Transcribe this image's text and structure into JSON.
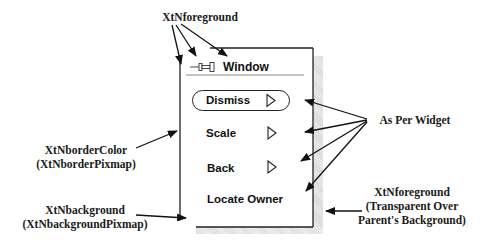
{
  "diagram": {
    "window": {
      "header_title": "Window",
      "pushpin_icon": "pushpin-icon",
      "menu_items": [
        {
          "label": "Dismiss",
          "has_submenu_triangle": true,
          "is_default": true
        },
        {
          "label": "Scale",
          "has_submenu_triangle": true,
          "is_default": false
        },
        {
          "label": "Back",
          "has_submenu_triangle": true,
          "is_default": false
        },
        {
          "label": "Locate Owner",
          "has_submenu_triangle": false,
          "is_default": false
        }
      ]
    },
    "annotations": {
      "top_foreground": "XtNforeground",
      "border_color_line1": "XtNborderColor",
      "border_color_line2": "(XtNborderPixmap)",
      "background_line1": "XtNbackground",
      "background_line2": "(XtNbackgroundPixmap)",
      "as_per_widget": "As Per Widget",
      "shadow_foreground_line1": "XtNforeground",
      "shadow_foreground_line2": "(Transparent Over",
      "shadow_foreground_line3": "Parent's Background)"
    },
    "colors": {
      "ink": "#1a1a1a",
      "shadow": "#e0e0e0",
      "background": "#ffffff"
    }
  }
}
